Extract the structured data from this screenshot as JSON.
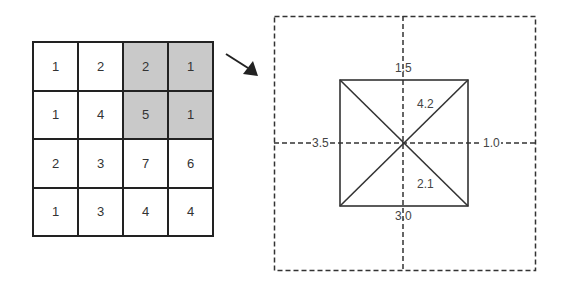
{
  "grid": {
    "rows": [
      [
        {
          "v": "1",
          "s": false
        },
        {
          "v": "2",
          "s": false
        },
        {
          "v": "2",
          "s": true
        },
        {
          "v": "1",
          "s": true
        }
      ],
      [
        {
          "v": "1",
          "s": false
        },
        {
          "v": "4",
          "s": false
        },
        {
          "v": "5",
          "s": true
        },
        {
          "v": "1",
          "s": true
        }
      ],
      [
        {
          "v": "2",
          "s": false
        },
        {
          "v": "3",
          "s": false
        },
        {
          "v": "7",
          "s": false
        },
        {
          "v": "6",
          "s": false
        }
      ],
      [
        {
          "v": "1",
          "s": false
        },
        {
          "v": "3",
          "s": false
        },
        {
          "v": "4",
          "s": false
        },
        {
          "v": "4",
          "s": false
        }
      ]
    ],
    "shade_color": "#c9c9c9"
  },
  "diagram": {
    "top": "1.5",
    "left": "3.5",
    "right": "1.0",
    "bottom": "3.0",
    "diag_upper": "4.2",
    "diag_lower": "2.1"
  }
}
